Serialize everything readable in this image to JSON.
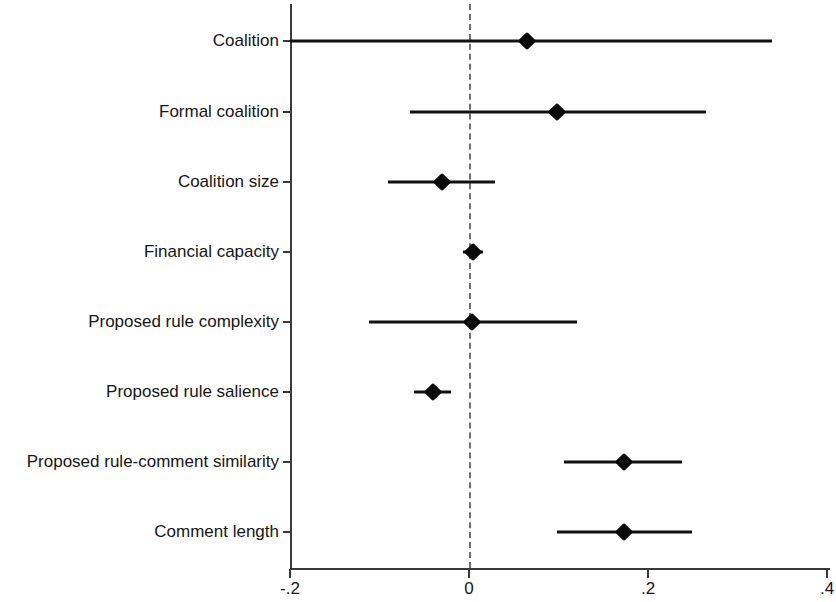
{
  "figure": {
    "background_color": "#ffffff",
    "line_color": "#111111",
    "axis_color": "#3a3a3a",
    "zero_line_color": "#6f6f6f"
  },
  "axis": {
    "x_ticks": [
      {
        "label": "-.2",
        "value": -0.2
      },
      {
        "label": "0",
        "value": 0
      },
      {
        "label": ".2",
        "value": 0.2
      },
      {
        "label": ".4",
        "value": 0.4
      }
    ],
    "x_min": -0.2,
    "x_max": 0.4,
    "zero_reference_label": "0"
  },
  "chart_data": {
    "type": "scatter",
    "subtype": "coefficient-plot",
    "title": "",
    "subtitle": "",
    "xlabel": "",
    "ylabel": "",
    "xlim": [
      -0.2,
      0.4
    ],
    "xticks": [
      -0.2,
      0,
      0.2,
      0.4
    ],
    "xticklabels": [
      "-.2",
      "0",
      ".2",
      ".4"
    ],
    "grid": false,
    "legend": null,
    "zero_line": 0,
    "zero_line_style": "dashed",
    "categories": [
      "Coalition",
      "Formal coalition",
      "Coalition size",
      "Financial capacity",
      "Proposed rule complexity",
      "Proposed rule salience",
      "Proposed rule-comment similarity",
      "Comment length"
    ],
    "series": [
      {
        "name": "Coefficient estimate",
        "marker": "diamond",
        "values": [
          0.065,
          0.098,
          -0.03,
          0.004,
          0.003,
          -0.04,
          0.173,
          0.173
        ],
        "ci_low": [
          -0.23,
          -0.066,
          -0.09,
          -0.007,
          -0.112,
          -0.061,
          0.106,
          0.098
        ],
        "ci_high": [
          0.339,
          0.265,
          0.029,
          0.016,
          0.121,
          -0.02,
          0.238,
          0.249
        ]
      }
    ],
    "points": [
      {
        "label": "Coalition",
        "estimate": 0.065,
        "ci_low": -0.23,
        "ci_high": 0.339,
        "ci_low_clipped": true
      },
      {
        "label": "Formal coalition",
        "estimate": 0.098,
        "ci_low": -0.066,
        "ci_high": 0.265,
        "ci_low_clipped": false
      },
      {
        "label": "Coalition size",
        "estimate": -0.03,
        "ci_low": -0.09,
        "ci_high": 0.029,
        "ci_low_clipped": false
      },
      {
        "label": "Financial capacity",
        "estimate": 0.004,
        "ci_low": -0.007,
        "ci_high": 0.016,
        "ci_low_clipped": false
      },
      {
        "label": "Proposed rule complexity",
        "estimate": 0.003,
        "ci_low": -0.112,
        "ci_high": 0.121,
        "ci_low_clipped": false
      },
      {
        "label": "Proposed rule salience",
        "estimate": -0.04,
        "ci_low": -0.061,
        "ci_high": -0.02,
        "ci_low_clipped": false
      },
      {
        "label": "Proposed rule-comment similarity",
        "estimate": 0.173,
        "ci_low": 0.106,
        "ci_high": 0.238,
        "ci_low_clipped": false
      },
      {
        "label": "Comment length",
        "estimate": 0.173,
        "ci_low": 0.098,
        "ci_high": 0.249,
        "ci_low_clipped": false
      }
    ]
  }
}
